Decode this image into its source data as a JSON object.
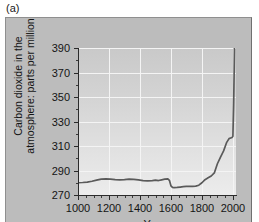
{
  "figure": {
    "panel_label": "(a)",
    "background_color": "#bcbcbc",
    "plot_background_top": "#c9c9c9",
    "plot_background_bottom": "#ececec",
    "gridline_color": "#f4f4f4",
    "axis_color": "#2b2b2b",
    "curve_color": "#5a5a5a"
  },
  "chart_data": {
    "type": "line",
    "title": "",
    "xlabel": "Year",
    "ylabel": "Carbon dioxide in the\natmosphere: parts per million",
    "xlim": [
      1000,
      2020
    ],
    "ylim": [
      270,
      390
    ],
    "xticks": [
      1000,
      1200,
      1400,
      1600,
      1800,
      2000
    ],
    "xtick_labels": [
      "1000",
      "1200",
      "1400",
      "1600",
      "1800",
      "2000"
    ],
    "x_minor_tick_step": 50,
    "yticks": [
      270,
      290,
      310,
      330,
      350,
      370,
      390
    ],
    "ytick_labels": [
      "270",
      "290",
      "310",
      "330",
      "350",
      "370",
      "390"
    ],
    "y_minor_tick_step": 10,
    "grid": true,
    "legend": null,
    "series": [
      {
        "name": "Atmospheric CO2",
        "x": [
          1000,
          1030,
          1060,
          1090,
          1120,
          1150,
          1180,
          1210,
          1240,
          1270,
          1300,
          1330,
          1360,
          1390,
          1420,
          1450,
          1480,
          1500,
          1520,
          1540,
          1560,
          1580,
          1590,
          1600,
          1610,
          1620,
          1640,
          1660,
          1680,
          1700,
          1720,
          1740,
          1760,
          1780,
          1800,
          1820,
          1840,
          1860,
          1880,
          1900,
          1920,
          1940,
          1960,
          1975,
          1985,
          1995,
          2000,
          2005,
          2008,
          2010
        ],
        "y": [
          280.0,
          280.2,
          280.5,
          281.2,
          282.2,
          283.0,
          283.2,
          283.0,
          282.6,
          282.3,
          282.6,
          283.0,
          282.8,
          282.3,
          281.8,
          281.6,
          281.8,
          282.2,
          281.8,
          282.4,
          283.0,
          283.2,
          282.0,
          277.5,
          276.2,
          276.0,
          276.2,
          276.5,
          276.8,
          277.0,
          277.0,
          277.0,
          277.2,
          278.0,
          280.0,
          282.5,
          284.0,
          285.5,
          288.0,
          295.5,
          301.0,
          306.0,
          313.0,
          316.0,
          316.5,
          317.0,
          318.0,
          345.0,
          370.0,
          390.0
        ],
        "units": "ppm"
      }
    ]
  }
}
